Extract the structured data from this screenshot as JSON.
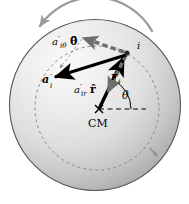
{
  "figure": {
    "type": "physics-diagram",
    "background_color": "#ffffff",
    "sphere": {
      "fill_light": "#f2f2f2",
      "fill_mid": "#d8d8d8",
      "fill_dark": "#b0b0b0",
      "outline_color": "#4a4a4a",
      "center_x": 95,
      "center_y": 105,
      "radius": 86
    },
    "orbit": {
      "name": "dashed-orbit-circle",
      "stroke": "#8a8a8a",
      "dash": "3,3",
      "center_x": 97,
      "center_y": 108,
      "radius": 62
    },
    "rotation_arrow": {
      "name": "rotation-direction-arrow",
      "stroke": "#9a9a9a",
      "direction": "counterclockwise"
    },
    "center_mark": {
      "label": "CM",
      "x": 99,
      "y": 109
    },
    "particle": {
      "label": "i",
      "x": 128,
      "y": 51
    },
    "reference_line": {
      "name": "horizontal-reference-dashed",
      "stroke": "#000000",
      "dash": "4,3"
    },
    "angle": {
      "label": "θ",
      "value_deg": 63
    },
    "vectors": [
      {
        "name": "position-vector-r",
        "label": "r′",
        "subscript": "i",
        "style": "solid-black",
        "color": "#000000",
        "from": "CM",
        "to": "i"
      },
      {
        "name": "acceleration-vector-a",
        "label": "a′",
        "subscript": "i",
        "style": "solid-black",
        "color": "#000000",
        "from": "i",
        "to": "lower-left"
      },
      {
        "name": "tangential-component",
        "label": "a′",
        "subscript": "iθ",
        "unit_vector": "θ̂",
        "style": "dashed-gray",
        "color": "#6e6e6e",
        "from": "i",
        "to": "upper-left"
      },
      {
        "name": "radial-component",
        "label": "a′",
        "subscript": "ir",
        "unit_vector": "r̂",
        "style": "dashed-gray",
        "color": "#6e6e6e",
        "from": "i",
        "to": "toward-CM"
      }
    ],
    "labels": {
      "cm": "CM",
      "particle_i": "i",
      "theta": "θ",
      "a_vector_base": "a",
      "a_vector_prime": "′",
      "a_vector_sub": "i",
      "r_vector_base": "r",
      "r_vector_prime": "′",
      "r_vector_sub": "i",
      "a_theta_base": "a",
      "a_theta_prime": "′",
      "a_theta_sub": "iθ",
      "a_theta_unit": "θ̂",
      "a_r_base": "a",
      "a_r_prime": "′",
      "a_r_sub": "ir",
      "a_r_unit": "r̂"
    }
  }
}
